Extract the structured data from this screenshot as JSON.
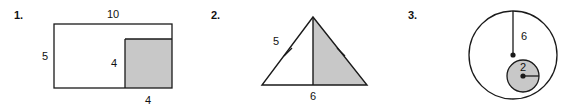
{
  "worksheet": {
    "background_color": "#ffffff",
    "ink_color": "#1a1a1a",
    "shade_color": "#c8c8c8"
  },
  "problems": [
    {
      "number": "1.",
      "shape": "rectangle-with-shaded-square",
      "labels": {
        "top": "10",
        "left": "5",
        "inner_vertical": "4",
        "inner_bottom": "4"
      }
    },
    {
      "number": "2.",
      "shape": "isosceles-triangle-half-shaded",
      "labels": {
        "left_side": "5",
        "base": "6"
      },
      "tick_marks": 2
    },
    {
      "number": "3.",
      "shape": "circle-with-shaded-inner-circle",
      "labels": {
        "large_radius": "6",
        "small_radius": "2"
      }
    }
  ]
}
